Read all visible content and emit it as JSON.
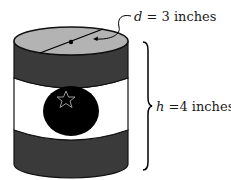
{
  "figure": {
    "type": "cylinder-can-diagram",
    "colors": {
      "top_face": "#b3b3b3",
      "dark_band": "#3a3a3a",
      "label_band": "#ffffff",
      "logo_circle": "#000000",
      "outline": "#111111",
      "star_outline": "#9a9a9a"
    },
    "diameter_label": {
      "variable": "d",
      "equals": " = ",
      "value": "3 inches"
    },
    "height_label": {
      "variable": "h",
      "equals": " =",
      "value": "4 inches"
    },
    "icons": {
      "logo": "star-icon",
      "brace": "right-curly-brace"
    }
  }
}
